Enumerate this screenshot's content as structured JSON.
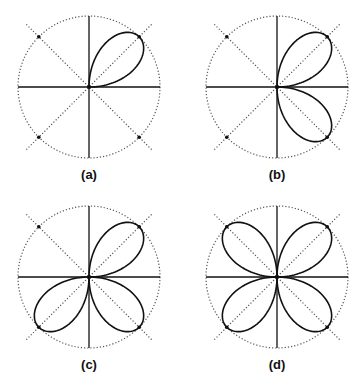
{
  "figure": {
    "panels": [
      {
        "id": "a",
        "label": "(a)",
        "cx": 89,
        "cy": 87,
        "quadrants": [
          "NE"
        ]
      },
      {
        "id": "b",
        "label": "(b)",
        "cx": 277,
        "cy": 87,
        "quadrants": [
          "NE",
          "SE"
        ]
      },
      {
        "id": "c",
        "label": "(c)",
        "cx": 89,
        "cy": 277,
        "quadrants": [
          "NE",
          "SE",
          "SW"
        ]
      },
      {
        "id": "d",
        "label": "(d)",
        "cx": 277,
        "cy": 277,
        "quadrants": [
          "NE",
          "SE",
          "SW",
          "NW"
        ]
      }
    ],
    "radius": 71,
    "label_offset_y": 88,
    "colors": {
      "curve": "#111111",
      "axis": "#111111",
      "dotted": "#555555",
      "dot": "#111111"
    }
  }
}
